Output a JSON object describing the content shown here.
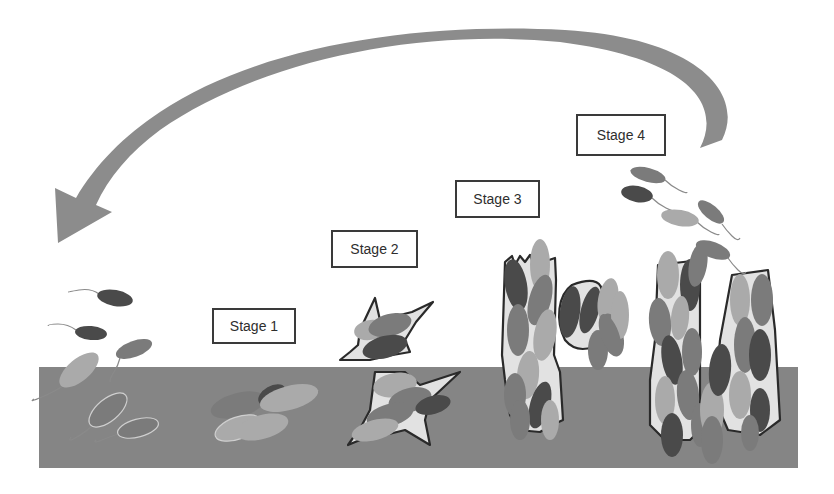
{
  "diagram": {
    "stages": [
      {
        "label": "Stage 1",
        "description": "reversible attachment"
      },
      {
        "label": "Stage 2",
        "description": "irreversible attachment with matrix"
      },
      {
        "label": "Stage 3",
        "description": "maturation"
      },
      {
        "label": "Stage 4",
        "description": "mature biofilm and dispersal"
      }
    ],
    "cycle_arrow": "dispersal-back-to-attachment",
    "colors": {
      "substrate": "#858585",
      "arrow": "#8c8c8c",
      "bacterium_dark": "#4a4a4a",
      "bacterium_mid": "#7b7b7b",
      "bacterium_light": "#aaaaaa",
      "matrix": "#e2e2e2",
      "outline": "#2a2a2a",
      "flagellum_light": "#cfcfcf"
    }
  }
}
